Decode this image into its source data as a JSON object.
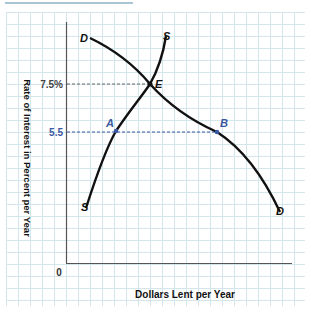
{
  "chart_data": {
    "type": "line",
    "title": "",
    "xlabel": "Dollars Lent per Year",
    "ylabel": "Rate of Interest in Percent per Year",
    "origin_label": "0",
    "y_ticks": [
      {
        "label": "7.5%",
        "value": 7.5
      },
      {
        "label": "5.5",
        "value": 5.5
      }
    ],
    "series": [
      {
        "name": "D",
        "description": "Demand for loans",
        "start_label": "D",
        "end_label": "D"
      },
      {
        "name": "S",
        "description": "Supply of loans",
        "start_label": "S",
        "end_label": "S"
      }
    ],
    "points": [
      {
        "label": "E",
        "rate": 7.5,
        "note": "equilibrium, intersection of S and D"
      },
      {
        "label": "A",
        "rate": 5.5,
        "note": "on supply curve S"
      },
      {
        "label": "B",
        "rate": 5.5,
        "note": "on demand curve D"
      }
    ],
    "grid": true,
    "colors": {
      "curve": "#111111",
      "accent": "#3a58a0",
      "grid": "#cfe3ea",
      "axis": "#444444"
    }
  },
  "labels": {
    "xlabel": "Dollars Lent per Year",
    "ylabel": "Rate of Interest in Percent per Year",
    "origin": "0",
    "tick_75": "7.5%",
    "tick_55": "5.5",
    "D_top": "D",
    "D_bottom": "D",
    "S_top": "S",
    "S_bottom": "S",
    "E": "E",
    "A": "A",
    "B": "B"
  }
}
